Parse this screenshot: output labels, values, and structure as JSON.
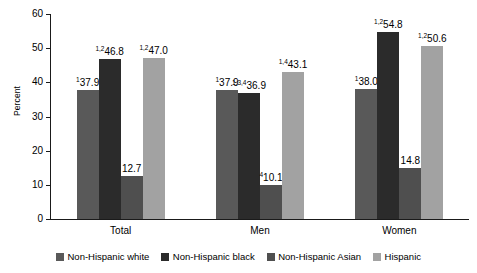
{
  "chart_data": {
    "type": "bar",
    "title": "",
    "subtitle": "",
    "xlabel": "",
    "ylabel": "Percent",
    "ylim": [
      0,
      60
    ],
    "yticks": [
      0,
      10,
      20,
      30,
      40,
      50,
      60
    ],
    "ytick_labels": [
      "0",
      "10",
      "20",
      "30",
      "40",
      "50",
      "60"
    ],
    "grid": false,
    "legend_position": "bottom",
    "categories": [
      "Total",
      "Men",
      "Women"
    ],
    "series": [
      {
        "name": "Non-Hispanic white",
        "color": "#595959",
        "values": [
          37.9,
          37.9,
          38.0
        ],
        "labels": [
          "37.9",
          "37.9",
          "38.0"
        ],
        "footnotes": [
          "1",
          "1",
          "1"
        ]
      },
      {
        "name": "Non-Hispanic black",
        "color": "#2b2b2b",
        "values": [
          46.8,
          36.9,
          54.8
        ],
        "labels": [
          "46.8",
          "36.9",
          "54.8"
        ],
        "footnotes": [
          "1,2",
          "1,3,4",
          "1,2"
        ]
      },
      {
        "name": "Non-Hispanic Asian",
        "color": "#4f4f4f",
        "values": [
          12.7,
          10.1,
          14.8
        ],
        "labels": [
          "12.7",
          "10.1",
          "14.8"
        ],
        "footnotes": [
          "",
          "4",
          ""
        ]
      },
      {
        "name": "Hispanic",
        "color": "#a2a2a2",
        "values": [
          47.0,
          43.1,
          50.6
        ],
        "labels": [
          "47.0",
          "43.1",
          "50.6"
        ],
        "footnotes": [
          "1,2",
          "1,4",
          "1,2"
        ]
      }
    ]
  },
  "axis": {
    "y_title": "Percent",
    "y_labels": [
      "60",
      "50",
      "40",
      "30",
      "20",
      "10",
      "0"
    ]
  },
  "groups": [
    {
      "label": "Total"
    },
    {
      "label": "Men"
    },
    {
      "label": "Women"
    }
  ],
  "legend": {
    "items": [
      {
        "label": "Non-Hispanic white",
        "color": "#595959"
      },
      {
        "label": "Non-Hispanic black",
        "color": "#2b2b2b"
      },
      {
        "label": "Non-Hispanic Asian",
        "color": "#4f4f4f"
      },
      {
        "label": "Hispanic",
        "color": "#a2a2a2"
      }
    ]
  }
}
